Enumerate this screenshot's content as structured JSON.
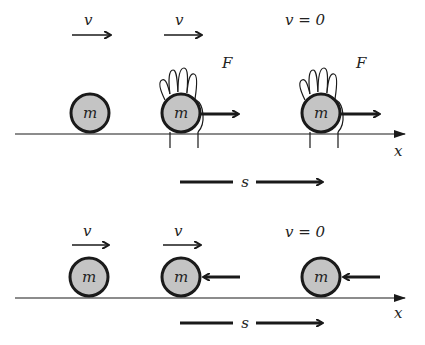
{
  "colors": {
    "ball_fill": "#c4c4c4",
    "ink": "#1a1a1a"
  },
  "top_panel": {
    "velocity_labels": [
      "v",
      "v",
      "v = 0"
    ],
    "force_labels": [
      "F",
      "F"
    ],
    "mass_labels": [
      "m",
      "m",
      "m"
    ],
    "axis_label": "x",
    "displacement_label": "s"
  },
  "bottom_panel": {
    "velocity_labels": [
      "v",
      "v",
      "v = 0"
    ],
    "mass_labels": [
      "m",
      "m",
      "m"
    ],
    "axis_label": "x",
    "displacement_label": "s"
  }
}
